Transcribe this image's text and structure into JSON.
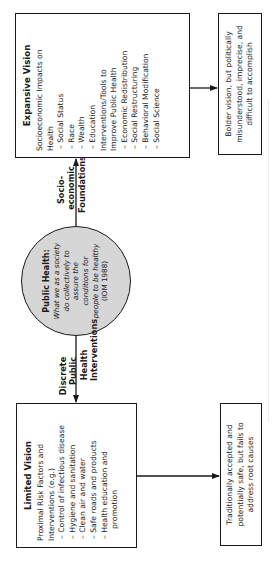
{
  "center": {
    "title": "Public Health:",
    "lines": [
      "What we as a society",
      "do collectively to",
      "assure the",
      "conditions for"
    ],
    "line5_prefix": "people to ",
    "line5_italic": "be healthy",
    "citation": "(IOM 1988)"
  },
  "upper_connector_label": [
    "Socio-",
    "economic",
    "Foundations"
  ],
  "lower_connector_label": [
    "Discrete",
    "Public",
    "Health",
    "Interventions"
  ],
  "expansive": {
    "title": "Expansive Vision",
    "lines": [
      "Socioeconomic Impacts on",
      "Health",
      "– Social Status",
      "– Race",
      "– Wealth",
      "– Education",
      "Interventions/Tools to",
      "Improve Public Health",
      "– Economic Redistribution",
      "– Social Restructuring",
      "– Behavioral Modification",
      "– Social Science"
    ]
  },
  "expansive_result": {
    "text": "Bolder vision, but politically misunderstood, imprecise, and difficult to accomplish"
  },
  "limited": {
    "title": "Limited Vision",
    "lines": [
      "Proximal Risk Factors and",
      "Interventions (e.g.)",
      "– Control of infectious disease",
      "– Hygiene and sanitation",
      "– Clean air and water",
      "– Safe roads and products",
      "– Health education and",
      "promotion"
    ]
  },
  "limited_result": {
    "text": "Traditionally accepted and potentially safe, but fails to address root causes"
  },
  "colors": {
    "ink": "#1a1a1a",
    "circle_fill": "#d6d6d6",
    "background": "#ffffff"
  }
}
